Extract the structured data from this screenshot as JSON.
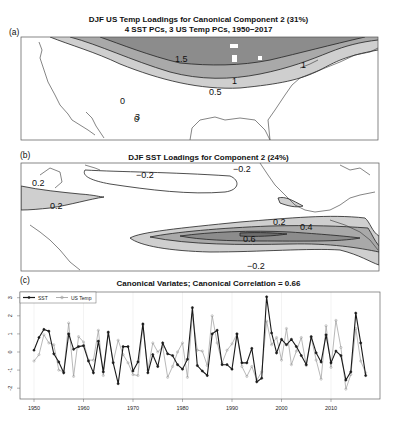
{
  "panel_a": {
    "label": "(a)",
    "title_line1": "DJF US Temp Loadings for Canonical Component 2 (31%)",
    "title_line2": "4 SST PCs, 3 US Temp PCs, 1950−2017",
    "contour_labels": [
      "1.5",
      "1",
      "1",
      "0.5"
    ]
  },
  "panel_b": {
    "label": "(b)",
    "title": "DJF SST Loadings for Component 2 (24%)",
    "contour_labels": [
      "0.2",
      "0.2",
      "−0.2",
      "−0.2",
      "0.2",
      "0.4",
      "0.6",
      "−0.2"
    ]
  },
  "panel_c": {
    "label": "(c)",
    "title": "Canonical Variates; Canonical Correlation = 0.66",
    "legend": [
      "SST",
      "US Temp"
    ]
  },
  "colors": {
    "fill_dark": "#8c8c8c",
    "fill_mid": "#a9a9a9",
    "fill_light": "#cfcfcf",
    "sst_line": "#1a1a1a",
    "ustemp_line": "#9a9a9a"
  },
  "chart_data": [
    {
      "type": "contour-map",
      "title": "DJF US Temp Loadings for Canonical Component 2 (31%)",
      "subtitle": "4 SST PCs, 3 US Temp PCs, 1950-2017",
      "contour_levels": [
        0.5,
        1,
        1.5
      ],
      "region": "Contiguous United States"
    },
    {
      "type": "contour-map",
      "title": "DJF SST Loadings for Component 2 (24%)",
      "contour_levels": [
        -0.2,
        0.2,
        0.4,
        0.6
      ],
      "region": "Tropical and North Pacific"
    },
    {
      "type": "line",
      "title": "Canonical Variates; Canonical Correlation = 0.66",
      "xlabel": "",
      "ylabel": "",
      "xlim": [
        1947,
        2020
      ],
      "ylim": [
        -2.5,
        3.2
      ],
      "x_ticks": [
        1950,
        1960,
        1970,
        1980,
        1990,
        2000,
        2010
      ],
      "y_ticks": [
        -2,
        -1,
        0,
        1,
        2,
        3
      ],
      "grid": true,
      "legend_position": "top-left",
      "x": [
        1950,
        1951,
        1952,
        1953,
        1954,
        1955,
        1956,
        1957,
        1958,
        1959,
        1960,
        1961,
        1962,
        1963,
        1964,
        1965,
        1966,
        1967,
        1968,
        1969,
        1970,
        1971,
        1972,
        1973,
        1974,
        1975,
        1976,
        1977,
        1978,
        1979,
        1980,
        1981,
        1982,
        1983,
        1984,
        1985,
        1986,
        1987,
        1988,
        1989,
        1990,
        1991,
        1992,
        1993,
        1994,
        1995,
        1996,
        1997,
        1998,
        1999,
        2000,
        2001,
        2002,
        2003,
        2004,
        2005,
        2006,
        2007,
        2008,
        2009,
        2010,
        2011,
        2012,
        2013,
        2014,
        2015,
        2016,
        2017
      ],
      "series": [
        {
          "name": "SST",
          "values": [
            0.1,
            0.8,
            1.25,
            1.15,
            -0.1,
            -0.55,
            -1.15,
            1.0,
            0.15,
            0.3,
            0.35,
            -0.5,
            -1.15,
            0.6,
            -1.1,
            1.1,
            -0.6,
            -1.75,
            0.3,
            0.3,
            -1.05,
            -0.55,
            1.55,
            -1.15,
            -0.15,
            -0.8,
            0.5,
            -0.1,
            -0.2,
            -0.7,
            -0.95,
            -0.4,
            2.45,
            -0.75,
            -1.05,
            -1.3,
            1.0,
            1.2,
            -0.7,
            -0.7,
            -0.95,
            1.0,
            -0.6,
            -0.6,
            0.2,
            -1.65,
            -1.45,
            3.05,
            1.05,
            -0.05,
            0.7,
            0.4,
            0.7,
            0.3,
            -0.2,
            -0.7,
            0.85,
            -0.05,
            -0.55,
            0.95,
            -0.6,
            0.05,
            -0.2,
            -1.55,
            -1.1,
            2.15,
            0.5,
            -1.3
          ]
        },
        {
          "name": "US Temp",
          "values": [
            -0.5,
            -0.15,
            0.95,
            0.5,
            0.4,
            -1.0,
            -1.1,
            1.6,
            -1.35,
            0.85,
            0.55,
            -0.45,
            -0.45,
            1.2,
            -1.3,
            1.05,
            -0.55,
            0.65,
            -0.15,
            -0.6,
            -1.25,
            -1.3,
            1.5,
            -1.0,
            0.5,
            0.0,
            0.3,
            -1.4,
            -0.8,
            0.0,
            0.5,
            -1.4,
            2.05,
            0.1,
            0.05,
            -0.75,
            2.0,
            0.5,
            -0.6,
            0.1,
            0.45,
            1.0,
            -0.8,
            -1.35,
            -0.8,
            -1.55,
            -1.1,
            1.7,
            0.4,
            0.8,
            -0.45,
            1.3,
            -0.7,
            0.05,
            0.8,
            -0.75,
            0.8,
            -0.45,
            -1.5,
            1.45,
            -0.85,
            1.75,
            0.25,
            -2.05,
            -1.25,
            1.3,
            -0.5,
            -1.15
          ]
        }
      ]
    }
  ]
}
